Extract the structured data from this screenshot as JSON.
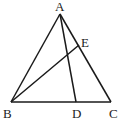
{
  "diagram": {
    "type": "triangle",
    "points": {
      "A": {
        "label": "A",
        "x": 60,
        "y": 14,
        "lx": 55,
        "ly": 11
      },
      "B": {
        "label": "B",
        "x": 11,
        "y": 102,
        "lx": 3,
        "ly": 118
      },
      "C": {
        "label": "C",
        "x": 111,
        "y": 102,
        "lx": 109,
        "ly": 118
      },
      "D": {
        "label": "D",
        "x": 76,
        "y": 102,
        "lx": 72,
        "ly": 118
      },
      "E": {
        "label": "E",
        "x": 79,
        "y": 45,
        "lx": 81,
        "ly": 47
      }
    },
    "segments": [
      [
        "A",
        "B"
      ],
      [
        "A",
        "C"
      ],
      [
        "B",
        "C"
      ],
      [
        "A",
        "D"
      ],
      [
        "B",
        "E"
      ]
    ]
  }
}
